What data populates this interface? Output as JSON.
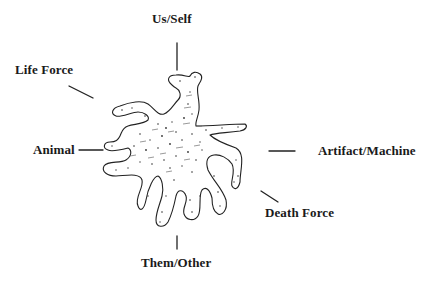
{
  "diagram": {
    "type": "radial-concept-map",
    "center": {
      "shape": "amoeba-blob",
      "fill": "stippled",
      "stroke_color": "#222222"
    },
    "labels": {
      "top": "Us/Self",
      "upper_left": "Life Force",
      "left": "Animal",
      "right": "Artifact/Machine",
      "lower_right": "Death Force",
      "bottom": "Them/Other"
    },
    "colors": {
      "ink": "#1a1a1a",
      "background": "#ffffff"
    }
  }
}
